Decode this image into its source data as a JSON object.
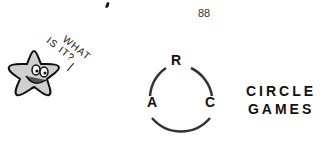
{
  "page_number": "88",
  "speech_bubble": {
    "line1": "WHAT",
    "line2": "IS IT?"
  },
  "diagram": {
    "letters": {
      "top": "R",
      "left": "A",
      "right": "C"
    }
  },
  "title": {
    "line1": "CIRCLE",
    "line2": "GAMES"
  },
  "colors": {
    "ink": "#111111",
    "circle": "#333333",
    "star_fill": "#d0d0d0"
  }
}
